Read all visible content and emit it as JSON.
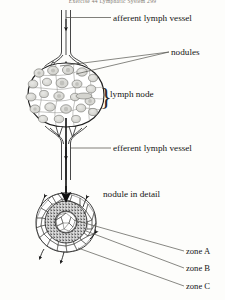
{
  "page": {
    "running_head": "Exercise 44  Lymphatic System    299",
    "background_color": "#fdfdfb",
    "ink_color": "#1a1a1a"
  },
  "labels": {
    "afferent": "afferent lymph vessel",
    "nodules": "nodules",
    "lymph_node": "lymph node",
    "efferent": "efferent lymph vessel",
    "nodule_detail": "nodule in detail",
    "zone_a": "zone A",
    "zone_b": "zone B",
    "zone_c": "zone C",
    "brace_glyph": "}"
  },
  "diagram": {
    "upper": {
      "name": "lymph-node-overview",
      "structures": [
        "afferent-lymph-vessel",
        "lymph-node-capsule",
        "internal-nodules",
        "valves",
        "efferent-lymph-vessel"
      ]
    },
    "lower": {
      "name": "nodule-detail",
      "zones": [
        {
          "id": "zone_a",
          "description": "germinal center, pale core"
        },
        {
          "id": "zone_b",
          "description": "dense stippled lymphocyte ring"
        },
        {
          "id": "zone_c",
          "description": "outer polygonal cell cortex"
        }
      ]
    }
  }
}
